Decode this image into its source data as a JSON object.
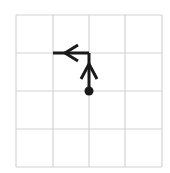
{
  "diagram": {
    "type": "grid-path",
    "grid": {
      "cols": 4,
      "rows": 4,
      "x_lines": [
        16,
        53,
        89,
        125,
        162
      ],
      "y_lines": [
        15,
        53,
        91,
        129,
        167
      ],
      "line_color": "#d4d4d4"
    },
    "path": {
      "color": "#1a1a1a",
      "start_dot": {
        "col": 2,
        "row": 2
      },
      "segments": [
        {
          "from": {
            "col": 2,
            "row": 2
          },
          "to": {
            "col": 2,
            "row": 1
          },
          "direction": "up"
        },
        {
          "from": {
            "col": 2,
            "row": 1
          },
          "to": {
            "col": 1,
            "row": 1
          },
          "direction": "left"
        }
      ]
    }
  }
}
